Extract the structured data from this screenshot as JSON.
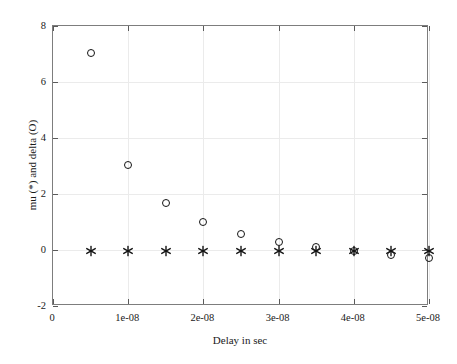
{
  "chart_data": {
    "type": "scatter",
    "title": "",
    "xlabel": "Delay in sec",
    "ylabel": "mu (*) and delta (O)",
    "xlim": [
      0,
      5e-08
    ],
    "ylim": [
      -2,
      8
    ],
    "grid": true,
    "legend": "none",
    "xticks": [
      0,
      1e-08,
      2e-08,
      3e-08,
      4e-08,
      5e-08
    ],
    "xticklabels": [
      "0",
      "1e-08",
      "2e-08",
      "3e-08",
      "4e-08",
      "5e-08"
    ],
    "yticks": [
      -2,
      0,
      2,
      4,
      6,
      8
    ],
    "yticklabels": [
      "-2",
      "0",
      "2",
      "4",
      "6",
      "8"
    ],
    "x": [
      5e-09,
      1e-08,
      1.5e-08,
      2e-08,
      2.5e-08,
      3e-08,
      3.5e-08,
      4e-08,
      4.5e-08,
      5e-08
    ],
    "series": [
      {
        "name": "delta (O)",
        "marker": "circle",
        "color": "#141414",
        "values": [
          7.05,
          3.02,
          1.67,
          1.0,
          0.57,
          0.3,
          0.12,
          -0.05,
          -0.18,
          -0.27
        ]
      },
      {
        "name": "mu (*)",
        "marker": "asterisk",
        "color": "#141414",
        "values": [
          -0.05,
          -0.05,
          -0.05,
          -0.05,
          -0.05,
          -0.05,
          -0.05,
          -0.05,
          -0.05,
          -0.05
        ]
      }
    ]
  }
}
